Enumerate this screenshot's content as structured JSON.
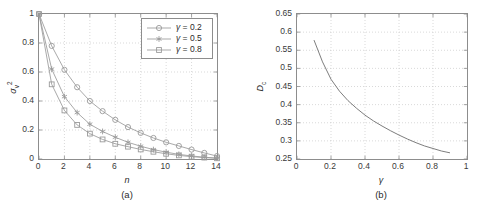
{
  "figure": {
    "panel_a_label": "(a)",
    "panel_b_label": "(b)"
  },
  "chart_data": [
    {
      "type": "line",
      "panel": "(a)",
      "title": "",
      "xlabel": "n",
      "ylabel": "σᵥ²",
      "ylabel_base": "σ",
      "ylabel_sub": "v",
      "ylabel_sup": "2",
      "grid": true,
      "xlim": [
        0,
        14
      ],
      "ylim": [
        0,
        1
      ],
      "xticks": [
        0,
        2,
        4,
        6,
        8,
        10,
        12,
        14
      ],
      "xticklabels": [
        "0",
        "2",
        "4",
        "6",
        "8",
        "10",
        "12",
        "14"
      ],
      "yticks": [
        0,
        0.2,
        0.4,
        0.6,
        0.8,
        1
      ],
      "yticklabels": [
        "0",
        "0.2",
        "0.4",
        "0.6",
        "0.8",
        "1"
      ],
      "x": [
        0,
        1,
        2,
        3,
        4,
        5,
        6,
        7,
        8,
        9,
        10,
        11,
        12,
        13,
        14
      ],
      "legend_position": "upper-right",
      "series": [
        {
          "name": "γ = 0.2",
          "gamma": 0.2,
          "marker": "circle",
          "color": "#9a9a9a",
          "values": [
            1.0,
            0.78,
            0.615,
            0.495,
            0.4,
            0.33,
            0.27,
            0.22,
            0.18,
            0.145,
            0.115,
            0.09,
            0.065,
            0.042,
            0.02
          ]
        },
        {
          "name": "γ = 0.5",
          "gamma": 0.5,
          "marker": "star",
          "color": "#9a9a9a",
          "values": [
            1.0,
            0.62,
            0.43,
            0.32,
            0.24,
            0.19,
            0.15,
            0.115,
            0.088,
            0.065,
            0.047,
            0.032,
            0.021,
            0.012,
            0.006
          ]
        },
        {
          "name": "γ = 0.8",
          "gamma": 0.8,
          "marker": "square",
          "color": "#9a9a9a",
          "values": [
            1.0,
            0.515,
            0.335,
            0.235,
            0.175,
            0.135,
            0.105,
            0.085,
            0.066,
            0.05,
            0.036,
            0.025,
            0.016,
            0.01,
            0.005
          ]
        }
      ]
    },
    {
      "type": "line",
      "panel": "(b)",
      "title": "",
      "xlabel": "γ",
      "ylabel": "Dᴄ",
      "ylabel_base": "D",
      "ylabel_sub": "c",
      "grid": true,
      "xlim": [
        0,
        1
      ],
      "ylim": [
        0.25,
        0.65
      ],
      "xticks": [
        0,
        0.2,
        0.4,
        0.6,
        0.8,
        1
      ],
      "xticklabels": [
        "0",
        "0.2",
        "0.4",
        "0.6",
        "0.8",
        "1"
      ],
      "yticks": [
        0.25,
        0.3,
        0.35,
        0.4,
        0.45,
        0.5,
        0.55,
        0.6,
        0.65
      ],
      "yticklabels": [
        "0.25",
        "0.3",
        "0.35",
        "0.4",
        "0.45",
        "0.5",
        "0.55",
        "0.6",
        "0.65"
      ],
      "legend_position": "none",
      "series": [
        {
          "name": "D_c",
          "marker": "none",
          "color": "#6e6e6e",
          "x": [
            0.1,
            0.15,
            0.2,
            0.25,
            0.3,
            0.35,
            0.4,
            0.45,
            0.5,
            0.55,
            0.6,
            0.65,
            0.7,
            0.75,
            0.8,
            0.85,
            0.9
          ],
          "values": [
            0.578,
            0.518,
            0.47,
            0.437,
            0.411,
            0.39,
            0.371,
            0.355,
            0.341,
            0.328,
            0.316,
            0.305,
            0.295,
            0.286,
            0.279,
            0.272,
            0.267
          ]
        }
      ]
    }
  ]
}
